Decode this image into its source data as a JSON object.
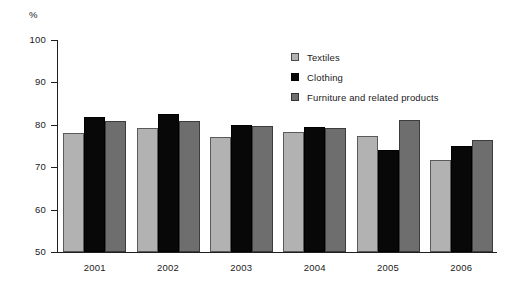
{
  "chart_data": {
    "type": "bar",
    "title": "",
    "subtitle": "",
    "xlabel": "",
    "ylabel": "%",
    "unit_label": "%",
    "categories": [
      "2001",
      "2002",
      "2003",
      "2004",
      "2005",
      "2006"
    ],
    "series": [
      {
        "name": "Textiles",
        "color": "#b2b2b2",
        "values": [
          78.1,
          79.3,
          77.1,
          78.4,
          77.3,
          71.7
        ]
      },
      {
        "name": "Clothing",
        "color": "#080808",
        "values": [
          81.9,
          82.6,
          79.9,
          79.4,
          74.0,
          75.1
        ]
      },
      {
        "name": "Furniture and related products",
        "color": "#6e6e6e",
        "values": [
          80.9,
          81.0,
          79.6,
          79.3,
          81.1,
          76.4
        ]
      }
    ],
    "ylim": [
      50,
      100
    ],
    "yticks": [
      50,
      60,
      70,
      80,
      90,
      100
    ],
    "ytick_labels": [
      "50",
      "60",
      "70",
      "80",
      "90",
      "100"
    ],
    "grid": false,
    "legend_position": "upper-center"
  }
}
